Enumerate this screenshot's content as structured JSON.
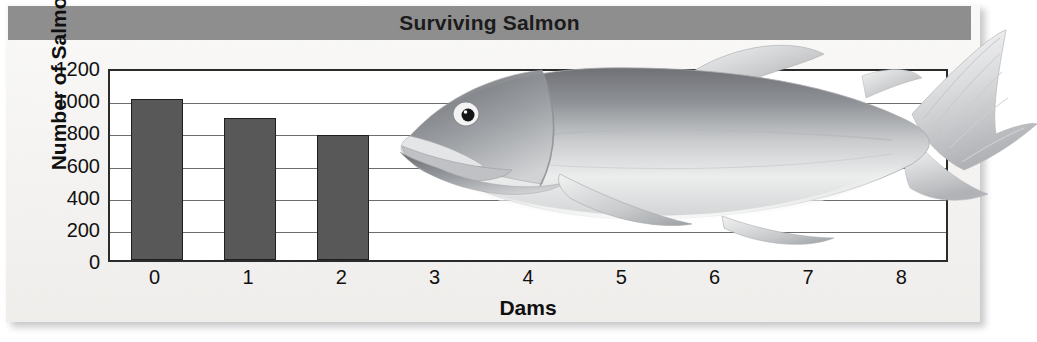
{
  "chart_data": {
    "type": "bar",
    "title": "Surviving Salmon",
    "xlabel": "Dams",
    "ylabel": "Number of Salmon",
    "categories": [
      "0",
      "1",
      "2",
      "3",
      "4",
      "5",
      "6",
      "7",
      "8"
    ],
    "values": [
      1000,
      880,
      780,
      null,
      null,
      null,
      null,
      null,
      null
    ],
    "ylim": [
      0,
      1200
    ],
    "yticks": [
      0,
      200,
      400,
      600,
      800,
      1000,
      1200
    ],
    "ytick_labels": [
      "0",
      "200",
      "400",
      "600",
      "800",
      "1000",
      "1200"
    ],
    "grid": true,
    "legend": "none",
    "bar_color": "#585858",
    "bar_edge_color": "#1f1f1f",
    "title_band_color": "#8e8e8e",
    "plot_background": "#ffffff",
    "panel_background": "#f4f3f1",
    "annotation": "salmon-illustration"
  },
  "illustration": {
    "name": "salmon-fish",
    "description": "Grayscale salmon illustration overlaying the plot area"
  }
}
